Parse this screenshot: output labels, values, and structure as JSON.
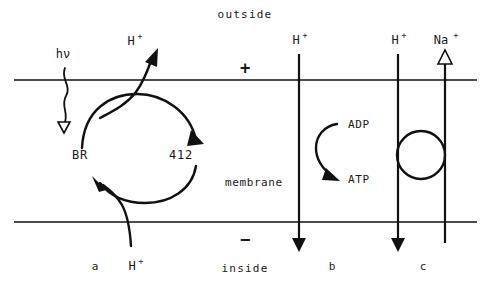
{
  "figure": {
    "regions": {
      "outside": "outside",
      "inside": "inside",
      "membrane": "membrane"
    },
    "charges": {
      "outer": "+",
      "inner": "−"
    },
    "panels": [
      {
        "id": "a",
        "label": "a"
      },
      {
        "id": "b",
        "label": "b"
      },
      {
        "id": "c",
        "label": "c"
      }
    ],
    "panel_a": {
      "light_label": "hν",
      "state_ground": "BR",
      "state_intermediate": "412",
      "proton_out": {
        "text": "H",
        "sup": "+"
      },
      "proton_in": {
        "text": "H",
        "sup": "+"
      }
    },
    "panel_b": {
      "proton": {
        "text": "H",
        "sup": "+"
      },
      "substrate": "ADP",
      "product": "ATP"
    },
    "panel_c": {
      "proton": {
        "text": "H",
        "sup": "+"
      },
      "sodium": {
        "text": "Na",
        "sup": "+"
      }
    }
  },
  "colors": {
    "ink": "#111111",
    "text": "#1a1a1a",
    "background": "#ffffff"
  }
}
